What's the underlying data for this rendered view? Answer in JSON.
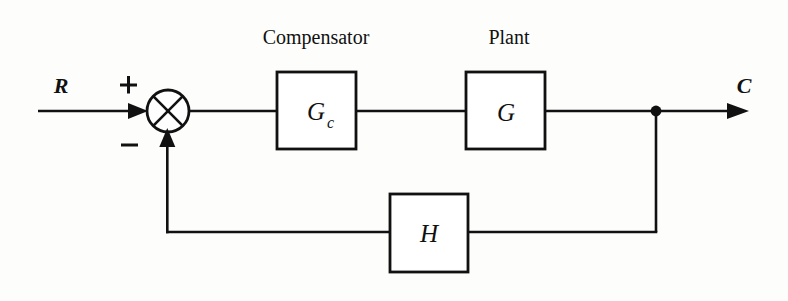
{
  "diagram": {
    "type": "control-block-diagram",
    "background_color": "#fdfdfc",
    "line_color": "#111111",
    "captions": {
      "compensator": "Compensator",
      "plant": "Plant"
    },
    "signals": {
      "input": "R",
      "output": "C"
    },
    "summing_junction": {
      "name": "summing-junction",
      "positive_sign": "+",
      "negative_sign": "−",
      "glyph": "circle-with-cross"
    },
    "blocks": [
      {
        "id": "compensator",
        "label": "G",
        "subscript": "c",
        "caption": "Compensator"
      },
      {
        "id": "plant",
        "label": "G",
        "subscript": "",
        "caption": "Plant"
      },
      {
        "id": "feedback",
        "label": "H",
        "subscript": "",
        "caption": ""
      }
    ],
    "nodes": [
      {
        "id": "takeoff-node",
        "name": "output-takeoff-node"
      }
    ],
    "connections": [
      {
        "from": "R",
        "to": "summing-junction",
        "sign": "+"
      },
      {
        "from": "summing-junction",
        "to": "compensator"
      },
      {
        "from": "compensator",
        "to": "plant"
      },
      {
        "from": "plant",
        "to": "takeoff-node"
      },
      {
        "from": "takeoff-node",
        "to": "C"
      },
      {
        "from": "takeoff-node",
        "to": "feedback"
      },
      {
        "from": "feedback",
        "to": "summing-junction",
        "sign": "−"
      }
    ]
  }
}
